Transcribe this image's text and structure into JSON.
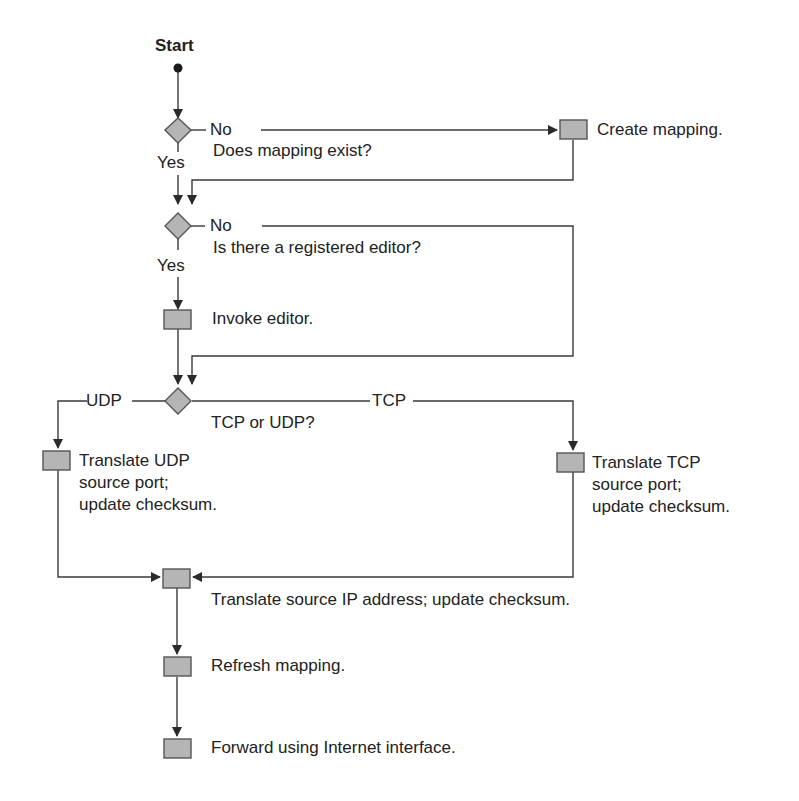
{
  "diagram": {
    "type": "flowchart",
    "colors": {
      "line": "#3a3a3a",
      "shape_fill": "#b5b5b5",
      "shape_stroke": "#555555",
      "text": "#222222"
    },
    "start": {
      "label": "Start"
    },
    "decisions": [
      {
        "id": "d1",
        "question": "Does mapping exist?",
        "yes_label": "Yes",
        "no_label": "No"
      },
      {
        "id": "d2",
        "question": "Is there a registered editor?",
        "yes_label": "Yes",
        "no_label": "No"
      },
      {
        "id": "d3",
        "question": "TCP or UDP?",
        "left_label": "UDP",
        "right_label": "TCP"
      }
    ],
    "processes": [
      {
        "id": "p_create",
        "label": "Create mapping."
      },
      {
        "id": "p_invoke",
        "label": "Invoke editor."
      },
      {
        "id": "p_udp",
        "label": "Translate UDP\nsource port;\nupdate checksum."
      },
      {
        "id": "p_tcp",
        "label": "Translate TCP\nsource port;\nupdate checksum."
      },
      {
        "id": "p_ip",
        "label": "Translate source IP address; update checksum."
      },
      {
        "id": "p_refresh",
        "label": "Refresh mapping."
      },
      {
        "id": "p_forward",
        "label": "Forward using Internet interface."
      }
    ],
    "edges": [
      {
        "from": "start",
        "to": "d1"
      },
      {
        "from": "d1",
        "to": "p_create",
        "label": "No"
      },
      {
        "from": "d1",
        "to": "d2",
        "label": "Yes"
      },
      {
        "from": "p_create",
        "to": "d2"
      },
      {
        "from": "d2",
        "to": "p_invoke",
        "label": "Yes"
      },
      {
        "from": "d2",
        "to": "d3",
        "label": "No"
      },
      {
        "from": "p_invoke",
        "to": "d3"
      },
      {
        "from": "d3",
        "to": "p_udp",
        "label": "UDP"
      },
      {
        "from": "d3",
        "to": "p_tcp",
        "label": "TCP"
      },
      {
        "from": "p_udp",
        "to": "p_ip"
      },
      {
        "from": "p_tcp",
        "to": "p_ip"
      },
      {
        "from": "p_ip",
        "to": "p_refresh"
      },
      {
        "from": "p_refresh",
        "to": "p_forward"
      }
    ]
  }
}
